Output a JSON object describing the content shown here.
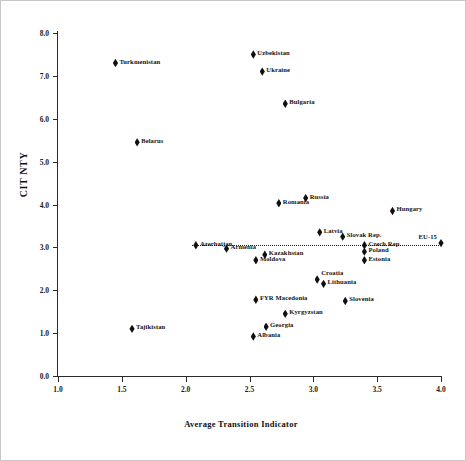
{
  "chart_data": {
    "type": "scatter",
    "title": "",
    "xlabel": "Average Transition Indicator",
    "ylabel": "CIT NTY",
    "xlim": [
      1.0,
      4.0
    ],
    "ylim": [
      0.0,
      8.0
    ],
    "xticks": [
      "1.0",
      "1.5",
      "2.0",
      "2.5",
      "3.0",
      "3.5",
      "4.0"
    ],
    "yticks": [
      "0.0",
      "1.0",
      "2.0",
      "3.0",
      "4.0",
      "5.0",
      "6.0",
      "7.0",
      "8.0"
    ],
    "grid": false,
    "legend": "none",
    "annotations": [
      {
        "name": "reference-line",
        "type": "horizontal-dotted",
        "y": 3.05,
        "x_start": 2.05,
        "x_end": 4.0
      }
    ],
    "points": [
      {
        "label": "Turkmenistan",
        "x": 1.45,
        "y": 7.3,
        "label_side": "right",
        "label_v": "mid"
      },
      {
        "label": "Uzbekistan",
        "x": 2.53,
        "y": 7.5,
        "label_side": "right",
        "label_v": "mid"
      },
      {
        "label": "Ukraine",
        "x": 2.6,
        "y": 7.1,
        "label_side": "right",
        "label_v": "mid"
      },
      {
        "label": "Bulgaria",
        "x": 2.78,
        "y": 6.35,
        "label_side": "right",
        "label_v": "mid"
      },
      {
        "label": "Belarus",
        "x": 1.62,
        "y": 5.45,
        "label_side": "right",
        "label_v": "mid"
      },
      {
        "label": "Russia",
        "x": 2.94,
        "y": 4.15,
        "label_side": "right",
        "label_v": "mid"
      },
      {
        "label": "Romania",
        "x": 2.73,
        "y": 4.03,
        "label_side": "right",
        "label_v": "mid"
      },
      {
        "label": "Hungary",
        "x": 3.62,
        "y": 3.85,
        "label_side": "right",
        "label_v": "mid"
      },
      {
        "label": "Latvia",
        "x": 3.05,
        "y": 3.35,
        "label_side": "right",
        "label_v": "mid"
      },
      {
        "label": "Slovak Rep.",
        "x": 3.23,
        "y": 3.25,
        "label_side": "right",
        "label_v": "mid"
      },
      {
        "label": "Azerbaijan",
        "x": 2.08,
        "y": 3.05,
        "label_side": "right",
        "label_v": "mid"
      },
      {
        "label": "Armenia",
        "x": 2.32,
        "y": 2.97,
        "label_side": "right",
        "label_v": "mid"
      },
      {
        "label": "Czech Rep.",
        "x": 3.4,
        "y": 3.05,
        "label_side": "right",
        "label_v": "mid"
      },
      {
        "label": "Poland",
        "x": 3.4,
        "y": 2.9,
        "label_side": "right",
        "label_v": "mid"
      },
      {
        "label": "Estonia",
        "x": 3.4,
        "y": 2.7,
        "label_side": "right",
        "label_v": "mid"
      },
      {
        "label": "EU-15",
        "x": 4.0,
        "y": 3.1,
        "label_side": "left",
        "label_v": "up"
      },
      {
        "label": "Kazakhstan",
        "x": 2.62,
        "y": 2.83,
        "label_side": "right",
        "label_v": "mid"
      },
      {
        "label": "Moldova",
        "x": 2.55,
        "y": 2.7,
        "label_side": "right",
        "label_v": "mid"
      },
      {
        "label": "Croatia",
        "x": 3.03,
        "y": 2.25,
        "label_side": "right",
        "label_v": "up"
      },
      {
        "label": "Lithuania",
        "x": 3.08,
        "y": 2.15,
        "label_side": "right",
        "label_v": "mid"
      },
      {
        "label": "FYR Macedonia",
        "x": 2.55,
        "y": 1.78,
        "label_side": "right",
        "label_v": "mid"
      },
      {
        "label": "Slovenia",
        "x": 3.25,
        "y": 1.75,
        "label_side": "right",
        "label_v": "mid"
      },
      {
        "label": "Kyrgyzstan",
        "x": 2.78,
        "y": 1.45,
        "label_side": "right",
        "label_v": "mid"
      },
      {
        "label": "Georgia",
        "x": 2.63,
        "y": 1.15,
        "label_side": "right",
        "label_v": "mid"
      },
      {
        "label": "Albania",
        "x": 2.53,
        "y": 0.92,
        "label_side": "right",
        "label_v": "mid"
      },
      {
        "label": "Tajikistan",
        "x": 1.58,
        "y": 1.1,
        "label_side": "right",
        "label_v": "mid"
      }
    ]
  }
}
